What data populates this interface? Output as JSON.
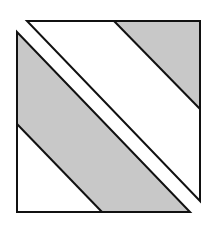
{
  "diagram": {
    "colors": {
      "background": "#ffffff",
      "shade": "#c8c8c8",
      "stroke": "#111111"
    },
    "upper_right_piece": {
      "outline": "27,21 200,21 200,201",
      "shaded_region": "114,21 200,21 200,109",
      "divider_line": {
        "x1": 114,
        "y1": 21,
        "x2": 200,
        "y2": 109
      }
    },
    "lower_left_piece": {
      "outline": "17,32 17,212 190,212",
      "shaded_region": "17,32 190,212 102,212 17,124",
      "divider_line": {
        "x1": 17,
        "y1": 124,
        "x2": 102,
        "y2": 212
      }
    }
  }
}
